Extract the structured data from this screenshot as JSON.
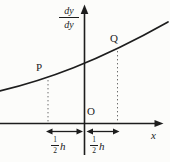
{
  "figure": {
    "colors": {
      "ink": "#1d1d1d",
      "dotted": "#6d6d6d",
      "background": "#fcfcfa"
    }
  },
  "labels": {
    "y_axis_fraction": {
      "numerator": "dy",
      "denominator": "dy"
    },
    "x_axis": "x",
    "origin": "O",
    "point_p": "P",
    "point_q": "Q",
    "interval_left": {
      "numerator": "1",
      "denominator": "2",
      "unit": "h"
    },
    "interval_right": {
      "numerator": "1",
      "denominator": "2",
      "unit": "h"
    }
  }
}
